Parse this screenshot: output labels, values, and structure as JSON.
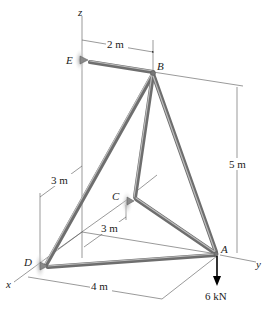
{
  "figure": {
    "type": "3d-space-truss",
    "axes": {
      "x": "x",
      "y": "y",
      "z": "z"
    },
    "joints": {
      "A": "A",
      "B": "B",
      "C": "C",
      "D": "D",
      "E": "E"
    },
    "members": [
      "AB",
      "AC",
      "AD",
      "BC",
      "BD",
      "BE"
    ],
    "supports": [
      "C",
      "D",
      "E"
    ],
    "dimensions": {
      "EB": "2 m",
      "height": "5 m",
      "D_offset": "3 m",
      "C_offset": "3 m",
      "DA": "4 m"
    },
    "load": {
      "label": "6 kN",
      "at": "A",
      "direction": "down"
    },
    "colors": {
      "member": "#7a7a7a",
      "member_highlight": "#b5b5b5",
      "line": "#555555",
      "support_glow": "#c8c8c8"
    }
  }
}
